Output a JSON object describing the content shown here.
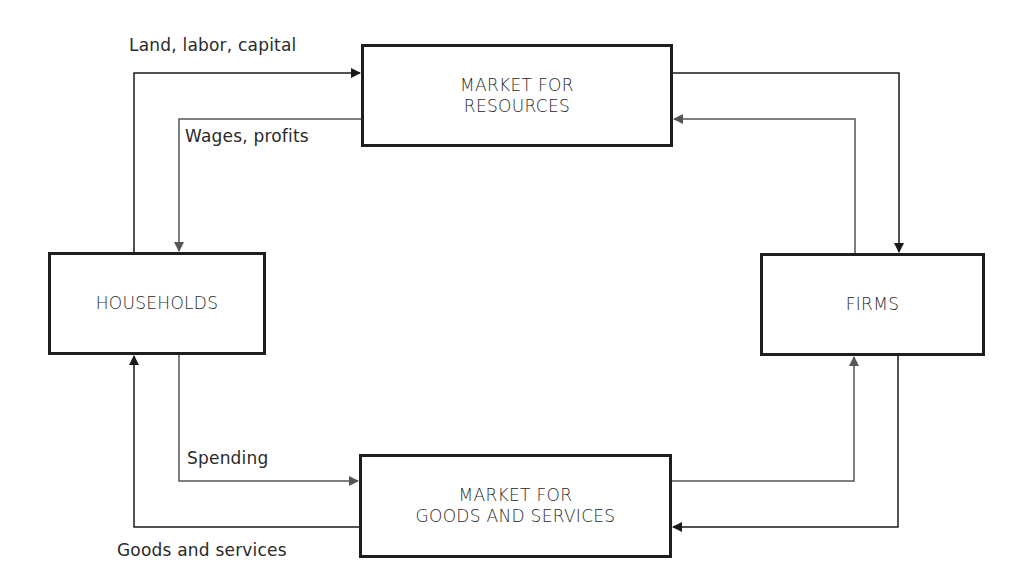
{
  "diagram": {
    "nodes": {
      "resources_market": {
        "line1": "MARKET FOR",
        "line2": "RESOURCES"
      },
      "households": {
        "label": "HOUSEHOLDS"
      },
      "firms": {
        "label": "FIRMS"
      },
      "goods_market": {
        "line1": "MARKET FOR",
        "line2": "GOODS AND SERVICES"
      }
    },
    "flow_labels": {
      "land_labor_capital": "Land, labor, capital",
      "wages_profits": "Wages, profits",
      "spending": "Spending",
      "goods_services": "Goods and services"
    },
    "edges": [
      {
        "from": "households",
        "to": "resources_market",
        "label": "Land, labor, capital",
        "type": "real"
      },
      {
        "from": "resources_market",
        "to": "households",
        "label": "Wages, profits",
        "type": "money"
      },
      {
        "from": "resources_market",
        "to": "firms",
        "label": "",
        "type": "real"
      },
      {
        "from": "firms",
        "to": "resources_market",
        "label": "",
        "type": "money"
      },
      {
        "from": "households",
        "to": "goods_market",
        "label": "Spending",
        "type": "money"
      },
      {
        "from": "goods_market",
        "to": "households",
        "label": "Goods and services",
        "type": "real"
      },
      {
        "from": "goods_market",
        "to": "firms",
        "label": "",
        "type": "money"
      },
      {
        "from": "firms",
        "to": "goods_market",
        "label": "",
        "type": "real"
      }
    ],
    "colors": {
      "real_flow": "#1a1a1a",
      "money_flow": "#555555",
      "box_border": "#1e1e1e"
    }
  }
}
